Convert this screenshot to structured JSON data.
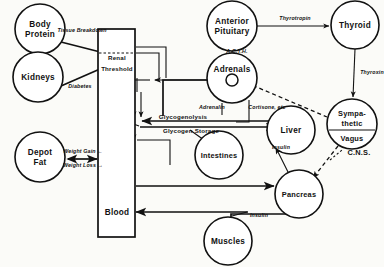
{
  "figure": {
    "type": "physiology-flow-diagram",
    "background_color": "#fbfbf8",
    "ink_color": "#111111"
  },
  "nodes": [
    {
      "id": "body-protein",
      "label_lines": [
        "Body",
        "Protein"
      ],
      "shape": "circle",
      "cx": 40,
      "cy": 29,
      "r": 25
    },
    {
      "id": "kidneys",
      "label_lines": [
        "Kidneys"
      ],
      "shape": "circle",
      "cx": 38,
      "cy": 77,
      "r": 25
    },
    {
      "id": "depot-fat",
      "label_lines": [
        "Depot",
        "Fat"
      ],
      "shape": "circle",
      "cx": 40,
      "cy": 157,
      "r": 25
    },
    {
      "id": "blood",
      "label_lines": [
        "Blood"
      ],
      "shape": "rect",
      "x": 98,
      "y": 29,
      "w": 37,
      "h": 208
    },
    {
      "id": "anterior-pituitary",
      "label_lines": [
        "Anterior",
        "Pituitary"
      ],
      "shape": "circle",
      "cx": 232,
      "cy": 26,
      "r": 25
    },
    {
      "id": "thyroid",
      "label_lines": [
        "Thyroid"
      ],
      "shape": "circle",
      "cx": 355,
      "cy": 25,
      "r": 24
    },
    {
      "id": "adrenals",
      "label_lines": [
        "Adrenals"
      ],
      "shape": "circle-with-core",
      "cx": 232,
      "cy": 78,
      "r": 25,
      "inner_r": 6
    },
    {
      "id": "liver",
      "label_lines": [
        "Liver"
      ],
      "shape": "circle",
      "cx": 291,
      "cy": 130,
      "r": 24
    },
    {
      "id": "intestines",
      "label_lines": [
        "Intestines"
      ],
      "shape": "circle",
      "cx": 219,
      "cy": 155,
      "r": 24
    },
    {
      "id": "pancreas",
      "label_lines": [
        "Pancreas"
      ],
      "shape": "circle",
      "cx": 299,
      "cy": 194,
      "r": 24
    },
    {
      "id": "muscles",
      "label_lines": [
        "Muscles"
      ],
      "shape": "circle",
      "cx": 228,
      "cy": 241,
      "r": 24
    },
    {
      "id": "sympathetic-vagus",
      "label_lines": [
        "Sympa-",
        "thetic",
        "Vagus"
      ],
      "shape": "circle-split",
      "cx": 352,
      "cy": 124,
      "r": 25
    }
  ],
  "edge_labels": [
    {
      "id": "tissue-breakdown",
      "text": "Tissue Breakdown",
      "x": 82,
      "y": 33
    },
    {
      "id": "diabetes",
      "text": "Diabetes",
      "x": 80,
      "y": 87
    },
    {
      "id": "weight-gain",
      "text": "Weight Gain ←",
      "x": 83,
      "y": 152
    },
    {
      "id": "weight-loss",
      "text": "Weight Loss →",
      "x": 83,
      "y": 166
    },
    {
      "id": "thyrotropin",
      "text": "Thyrotropin",
      "x": 295,
      "y": 19
    },
    {
      "id": "thyroxin",
      "text": "Thyroxin",
      "x": 371,
      "y": 73
    },
    {
      "id": "acth",
      "text": "A.C.T.H.",
      "x": 237,
      "y": 52
    },
    {
      "id": "adrenalin",
      "text": "Adrenalin",
      "x": 212,
      "y": 108
    },
    {
      "id": "cortisone",
      "text": "Cortisone, etc",
      "x": 266,
      "y": 108
    },
    {
      "id": "glycogenolysis",
      "text": "Glycogenolysis",
      "x": 183,
      "y": 117
    },
    {
      "id": "glycogen-storage",
      "text": "Glycogen Storage",
      "x": 190,
      "y": 130
    },
    {
      "id": "insulin-liver",
      "text": "Insulin",
      "x": 280,
      "y": 148
    },
    {
      "id": "insulin-muscles",
      "text": "Insulin",
      "x": 258,
      "y": 216
    },
    {
      "id": "cns",
      "text": "C.N.S.",
      "x": 358,
      "y": 152
    }
  ],
  "blood_inner_labels": [
    {
      "id": "renal",
      "text": "Renal",
      "x": 117,
      "y": 59
    },
    {
      "id": "threshold",
      "text": "Threshold",
      "x": 117,
      "y": 70
    }
  ]
}
